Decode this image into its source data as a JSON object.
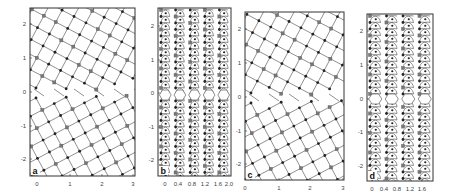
{
  "figure": {
    "panels": [
      {
        "id": "a",
        "letter": "a",
        "type": "rotated-square-lattice",
        "frame": {
          "x": 30,
          "y": 8,
          "w": 105,
          "h": 168
        },
        "x_ticks": [
          {
            "value": "0",
            "px": 37
          },
          {
            "value": "1",
            "px": 70
          },
          {
            "value": "2",
            "px": 102
          },
          {
            "value": "3",
            "px": 133
          }
        ],
        "y_ticks": [
          {
            "value": "2",
            "py": 24
          },
          {
            "value": "1",
            "py": 58
          },
          {
            "value": "0",
            "py": 92
          },
          {
            "value": "-1",
            "py": 126
          },
          {
            "value": "-2",
            "py": 159
          }
        ],
        "rotation_top": 28,
        "rotation_bottom": -28,
        "spacing": 13.5,
        "boundary_y": 92
      },
      {
        "id": "b",
        "letter": "b",
        "type": "zigzag-chain-lattice",
        "frame": {
          "x": 158,
          "y": 8,
          "w": 73,
          "h": 168
        },
        "x_ticks": [
          {
            "value": "0",
            "px": 165
          },
          {
            "value": "0.4",
            "px": 178
          },
          {
            "value": "0.8",
            "px": 192
          },
          {
            "value": "1.2",
            "px": 205
          },
          {
            "value": "1.6",
            "px": 218
          },
          {
            "value": "2.0",
            "px": 229
          }
        ],
        "y_ticks": [
          {
            "value": "2",
            "py": 26
          },
          {
            "value": "1",
            "py": 60
          },
          {
            "value": "0",
            "py": 93
          },
          {
            "value": "-1",
            "py": 127
          },
          {
            "value": "-2",
            "py": 160
          }
        ],
        "columns": 5,
        "row_step": 6.5,
        "boundary_y": 95
      },
      {
        "id": "c",
        "letter": "c",
        "type": "rotated-square-lattice",
        "frame": {
          "x": 245,
          "y": 12,
          "w": 99,
          "h": 168
        },
        "x_ticks": [
          {
            "value": "0",
            "px": 245
          },
          {
            "value": "1",
            "px": 279
          },
          {
            "value": "2",
            "px": 310
          },
          {
            "value": "3",
            "px": 343
          }
        ],
        "y_ticks": [
          {
            "value": "2",
            "py": 29
          },
          {
            "value": "1",
            "py": 63
          },
          {
            "value": "0",
            "py": 97
          },
          {
            "value": "-1",
            "py": 131
          },
          {
            "value": "-2",
            "py": 164
          }
        ],
        "rotation_top": 28,
        "rotation_bottom": -28,
        "spacing": 13.5,
        "boundary_y": 97
      },
      {
        "id": "d",
        "letter": "d",
        "type": "zigzag-chain-lattice",
        "frame": {
          "x": 367,
          "y": 14,
          "w": 66,
          "h": 167
        },
        "x_ticks": [
          {
            "value": "0",
            "px": 372
          },
          {
            "value": "0.4",
            "px": 384
          },
          {
            "value": "0.8",
            "px": 397
          },
          {
            "value": "1.2",
            "px": 410
          },
          {
            "value": "1.6",
            "px": 422
          }
        ],
        "y_ticks": [
          {
            "value": "2",
            "py": 31
          },
          {
            "value": "1",
            "py": 65
          },
          {
            "value": "0",
            "py": 99
          },
          {
            "value": "-1",
            "py": 132
          },
          {
            "value": "-2",
            "py": 166
          }
        ],
        "columns": 4,
        "row_step": 6.5,
        "boundary_y": 99
      }
    ],
    "colors": {
      "frame": "#333333",
      "bond": "#444444",
      "atom_dark": "#222222",
      "atom_gray": "#777777",
      "background": "#ffffff"
    }
  }
}
